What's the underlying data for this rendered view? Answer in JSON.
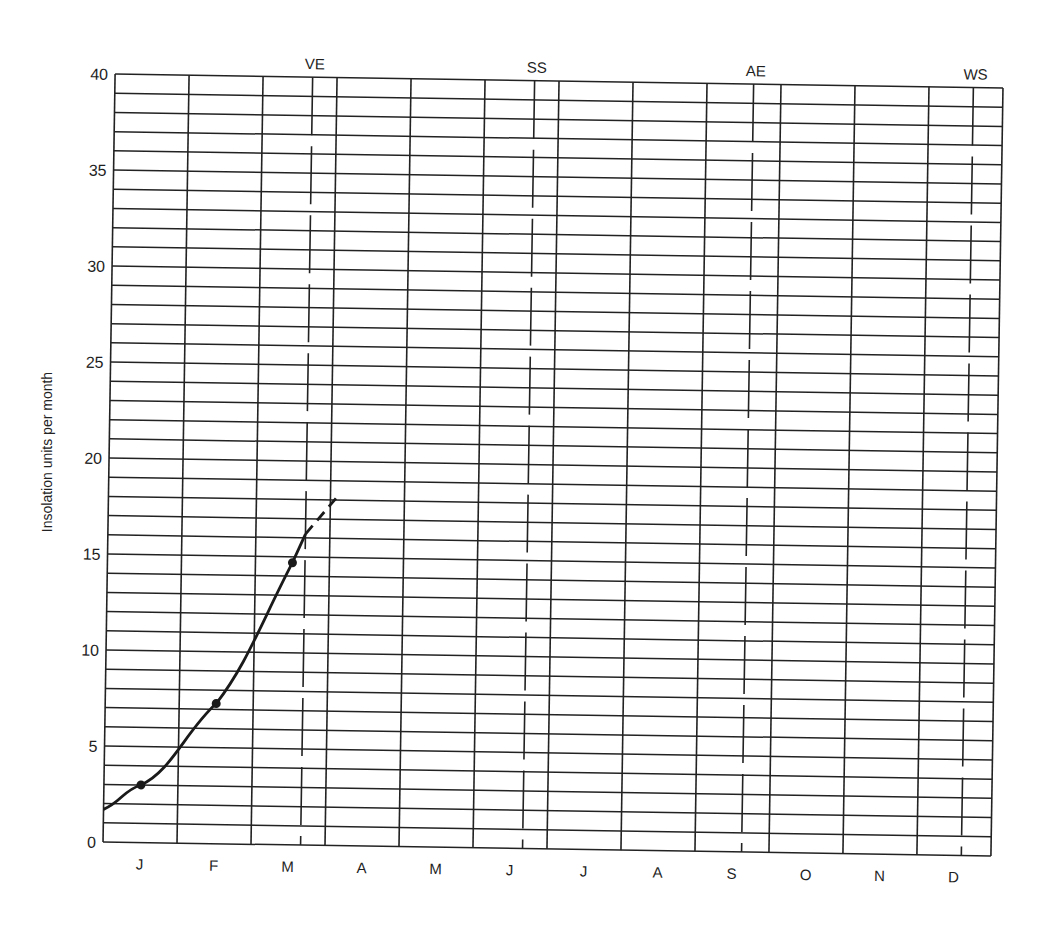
{
  "chart_data": {
    "type": "line",
    "title": "",
    "xlabel": "",
    "ylabel": "Insolation units per month",
    "ylim": [
      0,
      40
    ],
    "yticks": [
      0,
      5,
      10,
      15,
      20,
      25,
      30,
      35,
      40
    ],
    "y_minor_step": 1,
    "grid": true,
    "categories": [
      "J",
      "F",
      "M",
      "A",
      "M",
      "J",
      "J",
      "A",
      "S",
      "O",
      "N",
      "D"
    ],
    "series": [
      {
        "name": "Insolation",
        "points": [
          {
            "month": "J",
            "value": 3.0
          },
          {
            "month": "F",
            "value": 7.3
          },
          {
            "month": "M",
            "value": 14.7
          }
        ],
        "curve_start_value": 1.7,
        "dashed_extension_end_value": 18.3
      }
    ],
    "annotations": [
      {
        "label": "VE",
        "position_months": 2.67,
        "style": "dashed-vertical"
      },
      {
        "label": "SS",
        "position_months": 5.67,
        "style": "dashed-vertical"
      },
      {
        "label": "AE",
        "position_months": 8.63,
        "style": "dashed-vertical"
      },
      {
        "label": "WS",
        "position_months": 11.6,
        "style": "dashed-vertical"
      }
    ]
  },
  "labels": {
    "ytitle": "Insolation units per month"
  }
}
